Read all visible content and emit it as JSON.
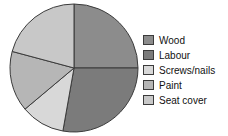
{
  "chart_data": {
    "type": "pie",
    "title": "",
    "subtitle": "",
    "xlabel": "",
    "ylabel": "",
    "legend_position": "right",
    "grid": false,
    "start_angle_deg": 0,
    "direction": "clockwise",
    "categories": [
      "Wood",
      "Labour",
      "Screws/nails",
      "Paint",
      "Seat cover"
    ],
    "values": [
      25,
      27.8,
      11.1,
      15.3,
      20.8
    ],
    "slices": [
      {
        "label": "Wood",
        "value": 25,
        "start_deg": 0,
        "end_deg": 90,
        "color": "#8c8c8c"
      },
      {
        "label": "Labour",
        "value": 27.8,
        "start_deg": 90,
        "end_deg": 190,
        "color": "#7b7b7b"
      },
      {
        "label": "Screws/nails",
        "value": 11.1,
        "start_deg": 190,
        "end_deg": 230,
        "color": "#d8d8d8"
      },
      {
        "label": "Paint",
        "value": 15.3,
        "start_deg": 230,
        "end_deg": 285,
        "color": "#b6b6b6"
      },
      {
        "label": "Seat cover",
        "value": 20.8,
        "start_deg": 285,
        "end_deg": 360,
        "color": "#c8c8c8"
      }
    ]
  },
  "legend": {
    "items": [
      {
        "label": "Wood",
        "color": "#8c8c8c"
      },
      {
        "label": "Labour",
        "color": "#7b7b7b"
      },
      {
        "label": "Screws/nails",
        "color": "#d8d8d8"
      },
      {
        "label": "Paint",
        "color": "#b6b6b6"
      },
      {
        "label": "Seat cover",
        "color": "#c8c8c8"
      }
    ]
  },
  "style": {
    "slice_outline": "#3b3b3b",
    "background": "#ffffff"
  }
}
